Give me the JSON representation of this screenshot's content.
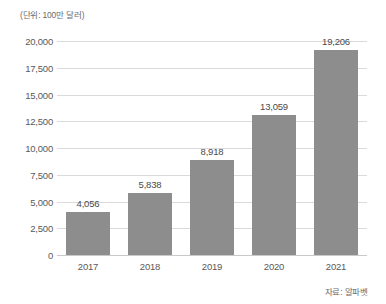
{
  "chart_data": {
    "type": "bar",
    "title": "",
    "subtitle": "",
    "unit_label": "(단위: 100만 달러)",
    "source_note": "자료: 알파벳",
    "xlabel": "",
    "ylabel": "",
    "categories": [
      "2017",
      "2018",
      "2019",
      "2020",
      "2021"
    ],
    "values": [
      4056,
      5838,
      8918,
      13059,
      19206
    ],
    "value_labels": [
      "4,056",
      "5,838",
      "8,918",
      "13,059",
      "19,206"
    ],
    "ylim": [
      0,
      20000
    ],
    "ytick_values": [
      0,
      2500,
      5000,
      7500,
      10000,
      12500,
      15000,
      17500,
      20000
    ],
    "ytick_labels": [
      "0",
      "2,500",
      "5,000",
      "7,500",
      "10,000",
      "12,500",
      "15,000",
      "17,500",
      "20,000"
    ],
    "grid": true,
    "grid_axis": "y",
    "legend": false,
    "legend_position": "none",
    "bar_color": "#8d8d8d",
    "grid_color": "#dadada",
    "background_color": "#ffffff",
    "text_color": "#4a4a4a"
  }
}
